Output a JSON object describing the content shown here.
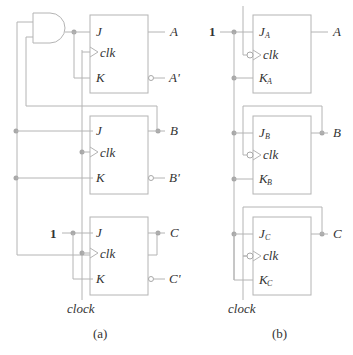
{
  "figure": {
    "panels": [
      {
        "caption": "(a)",
        "flip_flops": [
          {
            "j": "J",
            "clk": "clk",
            "k": "K",
            "q": "A",
            "q_bar": "A'"
          },
          {
            "j": "J",
            "clk": "clk",
            "k": "K",
            "q": "B",
            "q_bar": "B'"
          },
          {
            "j": "J",
            "clk": "clk",
            "k": "K",
            "q": "C",
            "q_bar": "C'"
          }
        ],
        "constant_input": "1",
        "clock_label": "clock",
        "gate": "AND"
      },
      {
        "caption": "(b)",
        "flip_flops": [
          {
            "j": "J",
            "j_sub": "A",
            "clk": "clk",
            "k": "K",
            "k_sub": "A",
            "q": "A"
          },
          {
            "j": "J",
            "j_sub": "B",
            "clk": "clk",
            "k": "K",
            "k_sub": "B",
            "q": "B"
          },
          {
            "j": "J",
            "j_sub": "C",
            "clk": "clk",
            "k": "K",
            "k_sub": "C",
            "q": "C"
          }
        ],
        "constant_input": "1",
        "clock_label": "clock"
      }
    ]
  },
  "colors": {
    "wire": "#b4b4b4",
    "text": "#333333",
    "background": "#ffffff"
  }
}
